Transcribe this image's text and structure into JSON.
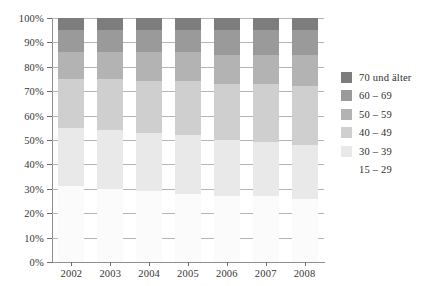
{
  "chart_data": {
    "type": "bar",
    "stacked": true,
    "normalized_percent": true,
    "title": "",
    "subtitle": "",
    "xlabel": "",
    "ylabel": "",
    "ylim": [
      0,
      100
    ],
    "ytick_labels": [
      "0%",
      "10%",
      "20%",
      "30%",
      "40%",
      "50%",
      "60%",
      "70%",
      "80%",
      "90%",
      "100%"
    ],
    "ytick_values": [
      0,
      10,
      20,
      30,
      40,
      50,
      60,
      70,
      80,
      90,
      100
    ],
    "grid": true,
    "legend_position": "right",
    "categories": [
      "2002",
      "2003",
      "2004",
      "2005",
      "2006",
      "2007",
      "2008"
    ],
    "series": [
      {
        "name": "15 – 29",
        "color": "#fbfbfb",
        "values": [
          31,
          30,
          29,
          28,
          27,
          27,
          26
        ]
      },
      {
        "name": "30 – 39",
        "color": "#e9e9e9",
        "values": [
          24,
          24,
          24,
          24,
          23,
          22,
          22
        ]
      },
      {
        "name": "40 – 49",
        "color": "#cfcfcf",
        "values": [
          20,
          21,
          21,
          22,
          23,
          24,
          24
        ]
      },
      {
        "name": "50 – 59",
        "color": "#b3b3b3",
        "values": [
          11,
          11,
          12,
          12,
          12,
          12,
          13
        ]
      },
      {
        "name": "60 – 69",
        "color": "#9a9a9a",
        "values": [
          9,
          9,
          9,
          9,
          10,
          10,
          10
        ]
      },
      {
        "name": "70 und älter",
        "color": "#7d7d7d",
        "values": [
          5,
          5,
          5,
          5,
          5,
          5,
          5
        ]
      }
    ],
    "legend_entries": [
      {
        "label": "70 und älter",
        "color": "#7d7d7d"
      },
      {
        "label": "60 – 69",
        "color": "#9a9a9a"
      },
      {
        "label": "50 – 59",
        "color": "#b3b3b3"
      },
      {
        "label": "40 – 49",
        "color": "#cfcfcf"
      },
      {
        "label": "30 – 39",
        "color": "#e9e9e9"
      },
      {
        "label": "15 – 29",
        "color": "#fbfbfb"
      }
    ]
  },
  "axes": {
    "axis_color": "#8e8e8e",
    "grid_color": "#b4b4b4"
  }
}
